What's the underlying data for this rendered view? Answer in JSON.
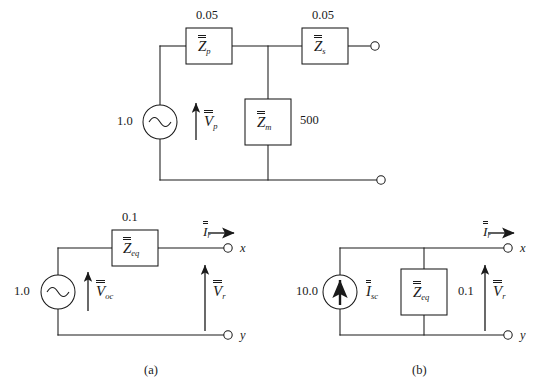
{
  "figure": {
    "line_color": "#1a1a1a",
    "background": "#ffffff"
  },
  "top_circuit": {
    "name": "two-port-source-network",
    "source": {
      "value": "1.0",
      "type": "ac-voltage-source",
      "label_base": "V",
      "label_sub": "p"
    },
    "elements": [
      {
        "name": "series-primary-impedance",
        "value": "0.05",
        "label_base": "Z",
        "label_sub": "p",
        "value_position": "above"
      },
      {
        "name": "magnetizing-impedance",
        "value": "500",
        "label_base": "Z",
        "label_sub": "m",
        "value_position": "right"
      },
      {
        "name": "series-secondary-impedance",
        "value": "0.05",
        "label_base": "Z",
        "label_sub": "s",
        "value_position": "above"
      }
    ]
  },
  "circuit_a": {
    "caption": "(a)",
    "name": "thevenin-equivalent",
    "source": {
      "value": "1.0",
      "type": "ac-voltage-source",
      "label_base": "V",
      "label_sub": "oc"
    },
    "impedance": {
      "value": "0.1",
      "label_base": "Z",
      "label_sub": "eq"
    },
    "current": {
      "label_base": "I",
      "label_sub": "r"
    },
    "voltage": {
      "label_base": "V",
      "label_sub": "r"
    },
    "terminals": [
      "x",
      "y"
    ]
  },
  "circuit_b": {
    "caption": "(b)",
    "name": "norton-equivalent",
    "source": {
      "value": "10.0",
      "type": "dc-current-source",
      "label_base": "I",
      "label_sub": "sc"
    },
    "impedance": {
      "value": "0.1",
      "label_base": "Z",
      "label_sub": "eq"
    },
    "current": {
      "label_base": "I",
      "label_sub": "r"
    },
    "voltage": {
      "label_base": "V",
      "label_sub": "r"
    },
    "terminals": [
      "x",
      "y"
    ]
  }
}
